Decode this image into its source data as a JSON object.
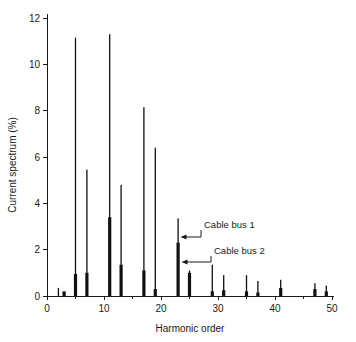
{
  "chart_data": {
    "type": "bar",
    "title": "",
    "xlabel": "Harmonic order",
    "ylabel": "Current spectrum (%)",
    "xlim": [
      0,
      50
    ],
    "ylim": [
      0,
      12
    ],
    "xticks": [
      0,
      10,
      20,
      30,
      40,
      50
    ],
    "yticks": [
      0,
      2,
      4,
      6,
      8,
      10,
      12
    ],
    "grid": false,
    "legend_position": "inline-annotations",
    "categories": [
      2,
      3,
      5,
      7,
      11,
      13,
      17,
      19,
      23,
      25,
      29,
      31,
      35,
      37,
      41,
      47,
      49
    ],
    "series": [
      {
        "name": "Cable bus 1",
        "style": "thin-line",
        "values": [
          0.35,
          0.0,
          11.15,
          5.45,
          11.3,
          4.8,
          8.15,
          6.4,
          3.35,
          1.1,
          1.35,
          0.9,
          0.9,
          0.65,
          0.7,
          0.55,
          0.45
        ]
      },
      {
        "name": "Cable bus 2",
        "style": "thick-bar",
        "values": [
          0.0,
          0.2,
          0.95,
          1.0,
          3.4,
          1.35,
          1.1,
          0.3,
          2.3,
          1.0,
          0.2,
          0.25,
          0.2,
          0.15,
          0.35,
          0.3,
          0.2
        ]
      }
    ],
    "annotations": [
      {
        "label": "Cable bus 1",
        "points_to_series": "Cable bus 1",
        "points_to_harmonic": 23,
        "points_to_value": 2.4
      },
      {
        "label": "Cable bus 2",
        "points_to_series": "Cable bus 2",
        "points_to_harmonic": 23,
        "points_to_value": 1.6
      }
    ],
    "colors": {
      "bars": "#111111",
      "axis": "#1a1a1a",
      "background": "#ffffff"
    }
  }
}
